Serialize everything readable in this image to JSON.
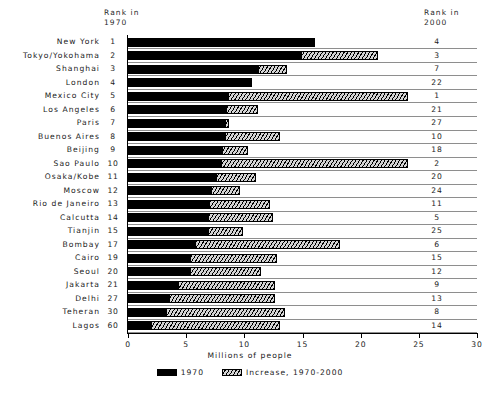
{
  "headers": {
    "rank_1970": "Rank in\n1970",
    "rank_2000": "Rank in\n2000"
  },
  "legend": {
    "items": [
      {
        "label": "1970",
        "swatch": "solid-black"
      },
      {
        "label": "Increase, 1970-2000",
        "swatch": "hatched"
      }
    ]
  },
  "chart_data": {
    "type": "bar",
    "orientation": "horizontal",
    "stacked": true,
    "title": "",
    "xlabel": "Millions of people",
    "ylabel": "",
    "xlim": [
      0,
      30
    ],
    "xticks": [
      0,
      5,
      10,
      15,
      20,
      25,
      30
    ],
    "grid": false,
    "legend_position": "bottom",
    "categories": [
      "New York",
      "Tokyo/Yokohama",
      "Shanghai",
      "London",
      "Mexico City",
      "Los Angeles",
      "Paris",
      "Buenos Aires",
      "Beijing",
      "Sao Paulo",
      "Osaka/Kobe",
      "Moscow",
      "Rio de Janeiro",
      "Calcutta",
      "Tianjin",
      "Bombay",
      "Cairo",
      "Seoul",
      "Jakarta",
      "Delhi",
      "Teheran",
      "Lagos"
    ],
    "series": [
      {
        "name": "1970",
        "values": [
          16.1,
          14.9,
          11.2,
          10.5,
          8.6,
          8.4,
          8.3,
          8.3,
          8.1,
          8.0,
          7.6,
          7.1,
          7.0,
          6.9,
          6.9,
          5.8,
          5.3,
          5.3,
          4.3,
          3.5,
          3.3,
          2.0
        ]
      },
      {
        "name": "Increase, 1970-2000",
        "values": [
          0.0,
          6.6,
          2.5,
          0.2,
          15.5,
          2.8,
          0.4,
          4.8,
          2.2,
          16.1,
          3.4,
          2.5,
          5.2,
          5.6,
          3.0,
          12.4,
          7.5,
          6.1,
          8.3,
          9.1,
          10.2,
          11.1
        ]
      }
    ],
    "totals": [
      16.1,
      21.5,
      13.7,
      10.7,
      24.1,
      11.2,
      8.7,
      13.1,
      10.3,
      24.1,
      11.0,
      9.6,
      12.2,
      12.5,
      9.9,
      18.2,
      12.8,
      11.4,
      12.6,
      12.6,
      13.5,
      13.1
    ],
    "rank_1970": [
      1,
      2,
      3,
      4,
      5,
      6,
      7,
      8,
      9,
      10,
      11,
      12,
      13,
      14,
      15,
      17,
      19,
      20,
      21,
      27,
      30,
      60
    ],
    "rank_2000": [
      4,
      3,
      7,
      22,
      1,
      21,
      27,
      10,
      18,
      2,
      20,
      24,
      11,
      5,
      25,
      6,
      15,
      12,
      9,
      13,
      8,
      14
    ]
  },
  "colors": {
    "bar_1970": "#000000",
    "bar_increase_fill": "#d4d4d4",
    "axis": "#000000",
    "row_rule": "#8e8e8e",
    "text": "#1a1a1a",
    "background": "#ffffff"
  }
}
